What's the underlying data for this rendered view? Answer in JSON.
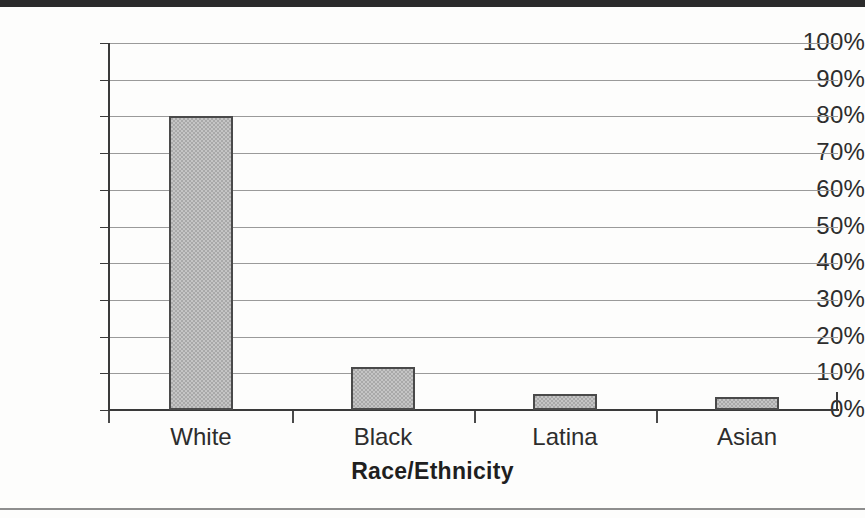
{
  "chart_data": {
    "type": "bar",
    "title": "",
    "xlabel": "Race/Ethnicity",
    "ylabel": "",
    "categories": [
      "White",
      "Black",
      "Latina",
      "Asian"
    ],
    "values": [
      80,
      11.7,
      4.4,
      3.5
    ],
    "ylim": [
      0,
      100
    ],
    "ytick_labels": [
      "100%",
      "90%",
      "80%",
      "70%",
      "60%",
      "50%",
      "40%",
      "30%",
      "20%",
      "10%",
      "0%"
    ],
    "ytick_values": [
      100,
      90,
      80,
      70,
      60,
      50,
      40,
      30,
      20,
      10,
      0
    ],
    "grid": true,
    "legend": false,
    "bar_fill_color": "#a9a9a9",
    "bar_border_color": "#4a4a4a",
    "axis_color": "#3a3a3a",
    "gridline_color": "#9a9a9a",
    "background_color": "#fdfdfc"
  }
}
